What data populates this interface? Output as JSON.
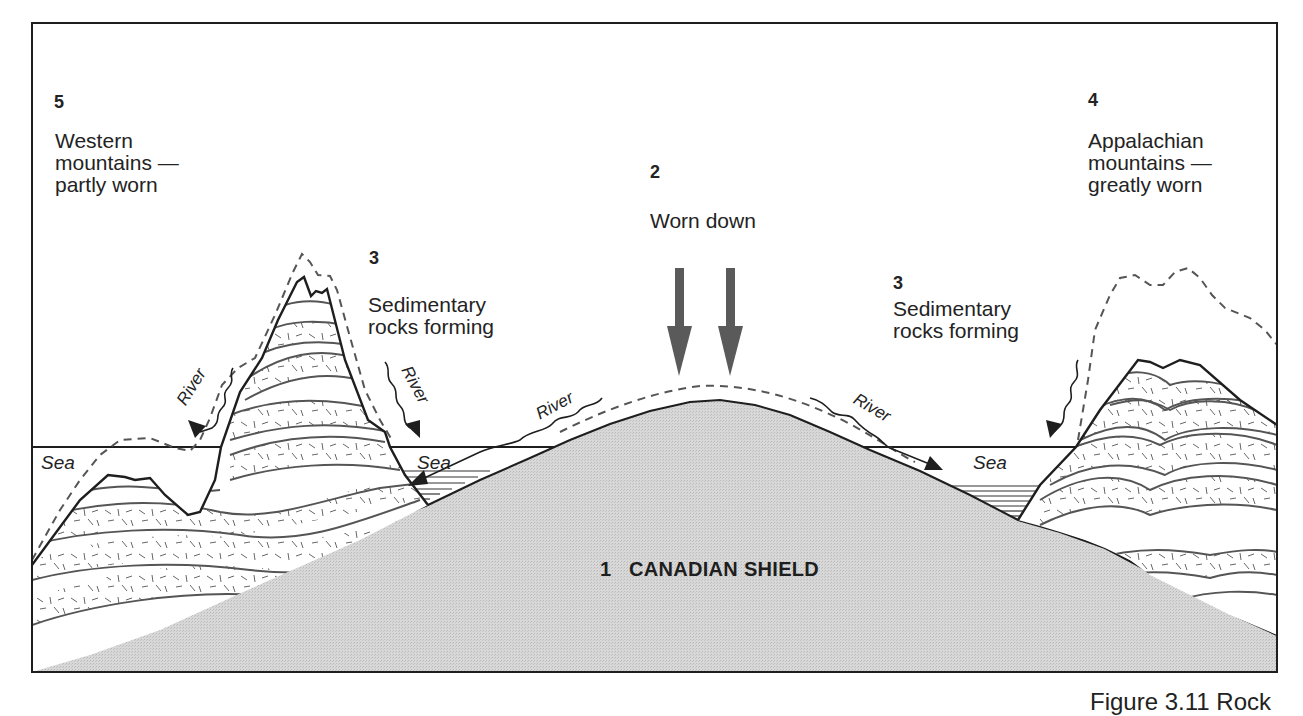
{
  "figure": {
    "type": "geological cross-section",
    "caption_partial": "Figure 3.11 Rock",
    "colors": {
      "shield_fill": "#d6d6d6",
      "line": "#1e1e1e",
      "strata_line": "#555555",
      "arrow_fill": "#5a5a5a",
      "background": "#ffffff"
    }
  },
  "labels": {
    "western": {
      "number": "5",
      "line1": "Western",
      "line2": "mountains —",
      "line3": "partly worn"
    },
    "worn_down": {
      "number": "2",
      "text": "Worn down"
    },
    "sedimentary_left": {
      "number": "3",
      "line1": "Sedimentary",
      "line2": "rocks forming"
    },
    "sedimentary_right": {
      "number": "3",
      "line1": "Sedimentary",
      "line2": "rocks forming"
    },
    "appalachian": {
      "number": "4",
      "line1": "Appalachian",
      "line2": "mountains —",
      "line3": "greatly worn"
    },
    "shield": {
      "number": "1",
      "text": "CANADIAN SHIELD"
    },
    "sea": [
      "Sea",
      "Sea",
      "Sea"
    ],
    "river": [
      "River",
      "River",
      "River",
      "River"
    ]
  }
}
